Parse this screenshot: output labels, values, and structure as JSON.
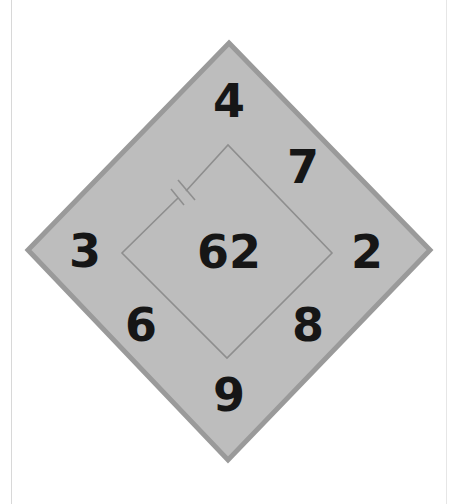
{
  "puzzle": {
    "type": "number-diamond",
    "center_value": "62",
    "outer_numbers": {
      "top": "4",
      "upper_right": "7",
      "right": "2",
      "lower_right": "8",
      "bottom": "9",
      "lower_left": "6",
      "left": "3"
    },
    "inner_square_symbol": "capacitor-gap",
    "colors": {
      "outer_fill": "#bdbdbd",
      "outer_border": "#9a9a9a",
      "inner_line": "#8e8e8e",
      "digits": "#161616",
      "background": "#ffffff"
    }
  }
}
